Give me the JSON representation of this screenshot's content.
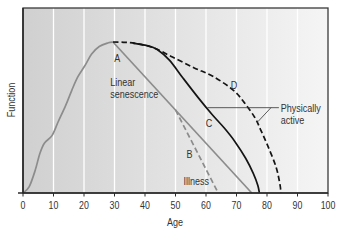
{
  "chart_data": {
    "type": "line",
    "title": "",
    "xlabel": "Age",
    "ylabel": "Function",
    "xlim": [
      0,
      100
    ],
    "ylim": [
      0,
      122.5
    ],
    "x_ticks": [
      0,
      10,
      20,
      30,
      40,
      50,
      60,
      70,
      80,
      90,
      100
    ],
    "y_ticks": [],
    "grid": {
      "vertical": true,
      "horizontal": false
    },
    "legend": null,
    "colors": {
      "background_left": "#d0d0d0",
      "background_right": "#f5f5f5",
      "grid": "#ffffff",
      "axis": "#2a2a2a",
      "gray_curve": "#8c8c8c",
      "black_curve": "#141414"
    },
    "series": [
      {
        "name": "Growth (unlabeled)",
        "label": "",
        "color": "#8c8c8c",
        "dashed": false,
        "points": [
          [
            0,
            0
          ],
          [
            2,
            4
          ],
          [
            4,
            15
          ],
          [
            5.5,
            26
          ],
          [
            7,
            33
          ],
          [
            9.5,
            38
          ],
          [
            11.5,
            47
          ],
          [
            14,
            58
          ],
          [
            16,
            68
          ],
          [
            18,
            77
          ],
          [
            20.5,
            85
          ],
          [
            22.5,
            92
          ],
          [
            25,
            97
          ],
          [
            28,
            99.5
          ],
          [
            29.5,
            100
          ]
        ]
      },
      {
        "name": "A – Linear senescence",
        "label": "A",
        "color": "#8c8c8c",
        "dashed": false,
        "points": [
          [
            29.5,
            100
          ],
          [
            75,
            0
          ]
        ]
      },
      {
        "name": "B – Illness",
        "label": "B",
        "color": "#8c8c8c",
        "dashed": true,
        "points": [
          [
            50,
            55
          ],
          [
            64,
            0
          ]
        ]
      },
      {
        "name": "D – Physically active",
        "label": "D",
        "color": "#141414",
        "dashed": true,
        "points": [
          [
            29.5,
            100
          ],
          [
            33,
            99.8
          ],
          [
            37,
            99
          ],
          [
            43,
            96
          ],
          [
            49,
            90
          ],
          [
            56,
            83
          ],
          [
            62.5,
            77
          ],
          [
            69,
            68
          ],
          [
            72.5,
            60
          ],
          [
            76,
            50
          ],
          [
            78,
            41.5
          ],
          [
            80.3,
            31
          ],
          [
            83,
            17
          ],
          [
            84.3,
            5
          ],
          [
            84.5,
            0
          ]
        ]
      },
      {
        "name": "C – Physically active",
        "label": "C",
        "color": "#141414",
        "dashed": false,
        "points": [
          [
            36,
            99.2
          ],
          [
            41,
            97.5
          ],
          [
            44,
            95
          ],
          [
            48,
            88
          ],
          [
            52.5,
            76
          ],
          [
            57.5,
            63
          ],
          [
            62,
            52
          ],
          [
            66,
            43
          ],
          [
            69.5,
            34
          ],
          [
            73,
            23
          ],
          [
            75.5,
            13
          ],
          [
            77,
            5
          ],
          [
            77.5,
            0
          ]
        ]
      }
    ],
    "annotations": [
      {
        "text": "A",
        "x": 29.9,
        "y": 87
      },
      {
        "text": "Linear",
        "x": 28.6,
        "y": 71
      },
      {
        "text": "senescence",
        "x": 28.6,
        "y": 63
      },
      {
        "text": "B",
        "x": 53.6,
        "y": 23
      },
      {
        "text": "Illness",
        "x": 52.6,
        "y": 5.3
      },
      {
        "text": "C",
        "x": 59.9,
        "y": 43.5
      },
      {
        "text": "D",
        "x": 68.1,
        "y": 69
      },
      {
        "text": "Physically",
        "x": 84.5,
        "y": 53.6
      },
      {
        "text": "active",
        "x": 84.5,
        "y": 45.7
      }
    ],
    "leader_lines": [
      [
        [
          60.5,
          56.5
        ],
        [
          83.9,
          56.5
        ]
      ],
      [
        [
          81.3,
          56.5
        ],
        [
          77.0,
          47.2
        ]
      ]
    ]
  }
}
